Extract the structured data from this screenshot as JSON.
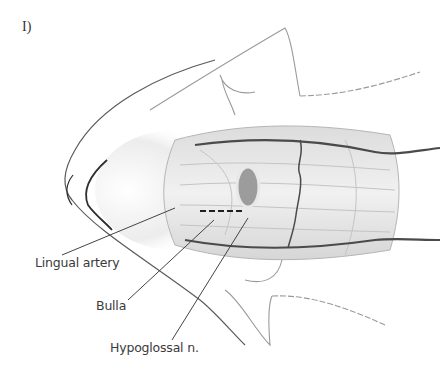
{
  "figure": {
    "panel_label": "I)",
    "signature": "artist signature (illegible)"
  },
  "labels": [
    {
      "id": "lingual-artery",
      "text": "Lingual artery"
    },
    {
      "id": "bulla",
      "text": "Bulla"
    },
    {
      "id": "hypoglossal",
      "text": "Hypoglossal n."
    }
  ],
  "colors": {
    "vessel": "#4a4a4a",
    "outline": "#8a8a8a",
    "muscle": "#d8d8d8",
    "leader": "#444444",
    "background": "#ffffff"
  }
}
